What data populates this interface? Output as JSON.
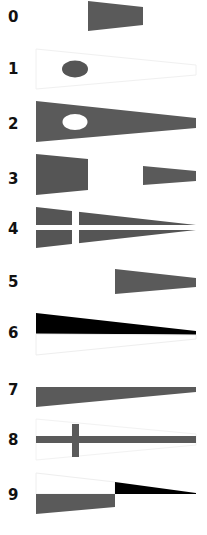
{
  "colors": {
    "gray": "#5a5a5a",
    "black": "#000000",
    "white": "#ffffff",
    "outline": "#eeeeee"
  },
  "flags": [
    {
      "label": "0",
      "description": "gray short tapered flag",
      "top": 17
    },
    {
      "label": "1",
      "description": "white pennant with gray oval",
      "top": 62
    },
    {
      "label": "2",
      "description": "gray pennant with white oval",
      "top": 116
    },
    {
      "label": "3",
      "description": "gray hoist and gray fly, white middle",
      "top": 170
    },
    {
      "label": "4",
      "description": "gray pennant with white cross",
      "top": 221
    },
    {
      "label": "5",
      "description": "white hoist, gray fly",
      "top": 276
    },
    {
      "label": "6",
      "description": "black over white pennant",
      "top": 327
    },
    {
      "label": "7",
      "description": "white over gray pennant",
      "top": 385
    },
    {
      "label": "8",
      "description": "white pennant with gray cross",
      "top": 432
    },
    {
      "label": "9",
      "description": "white over gray hoist, black fly",
      "top": 489
    }
  ]
}
